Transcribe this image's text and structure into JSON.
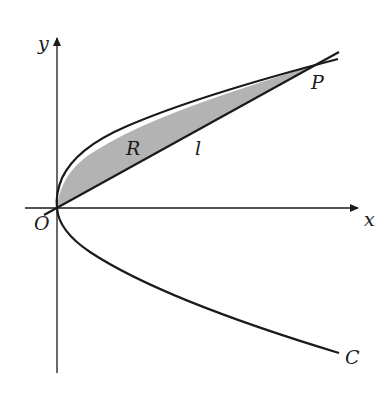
{
  "diagram": {
    "axes": {
      "x_label": "x",
      "y_label": "y",
      "origin_label": "O"
    },
    "curve_label": "C",
    "line_label": "l",
    "region_label": "R",
    "point_label": "P",
    "colors": {
      "stroke": "#1a1a1a",
      "region_fill": "#b3b3b3",
      "background": "#ffffff"
    }
  }
}
